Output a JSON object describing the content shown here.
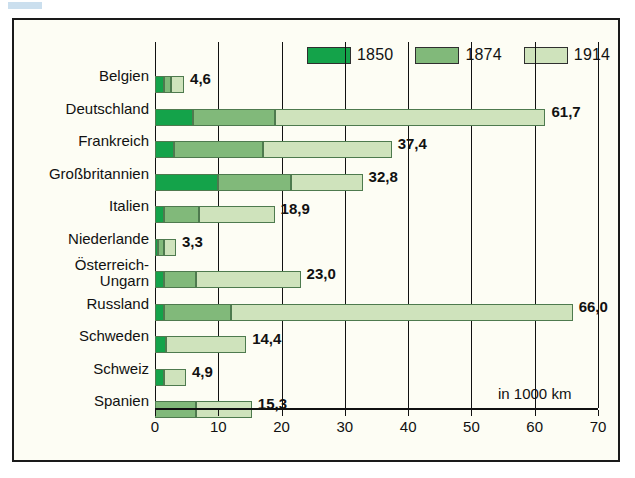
{
  "chart_data": {
    "type": "bar",
    "orientation": "horizontal",
    "stacked": true,
    "title": "",
    "subtitle": "",
    "xlabel": "in 1000 km",
    "ylabel": "",
    "xlim": [
      0,
      70
    ],
    "xticks": [
      0,
      10,
      20,
      30,
      40,
      50,
      60,
      70
    ],
    "xtick_labels": [
      "0",
      "10",
      "20",
      "30",
      "40",
      "50",
      "60",
      "70"
    ],
    "grid": true,
    "grid_axis": "x",
    "legend_position": "top-right",
    "decimal_separator": ",",
    "categories": [
      "Belgien",
      "Deutschland",
      "Frankreich",
      "Großbritannien",
      "Italien",
      "Niederlande",
      "Österreich-Ungarn",
      "Russland",
      "Schweden",
      "Schweiz",
      "Spanien"
    ],
    "category_labels": [
      [
        "Belgien"
      ],
      [
        "Deutschland"
      ],
      [
        "Frankreich"
      ],
      [
        "Großbritannien"
      ],
      [
        "Italien"
      ],
      [
        "Niederlande"
      ],
      [
        "Österreich-",
        "Ungarn"
      ],
      [
        "Russland"
      ],
      [
        "Schweden"
      ],
      [
        "Schweiz"
      ],
      [
        "Spanien"
      ]
    ],
    "series": [
      {
        "name": "1850",
        "color": "#14a34a",
        "values": [
          1.5,
          6.0,
          3.0,
          10.0,
          1.5,
          0.4,
          1.5,
          1.5,
          1.8,
          1.4,
          0.0
        ]
      },
      {
        "name": "1874",
        "color": "#81b97a",
        "values": [
          1.0,
          13.0,
          14.0,
          11.5,
          5.5,
          1.0,
          5.0,
          10.5,
          0.0,
          0.0,
          6.5
        ]
      },
      {
        "name": "1914",
        "color": "#cfe3bc",
        "values": [
          2.1,
          42.7,
          20.4,
          11.3,
          11.9,
          1.9,
          16.5,
          54.0,
          12.6,
          3.5,
          8.8
        ]
      }
    ],
    "totals": [
      4.6,
      61.7,
      37.4,
      32.8,
      18.9,
      3.3,
      23.0,
      66.0,
      14.4,
      4.9,
      15.3
    ],
    "total_labels": [
      "4,6",
      "61,7",
      "37,4",
      "32,8",
      "18,9",
      "3,3",
      "23,0",
      "66,0",
      "14,4",
      "4,9",
      "15,3"
    ],
    "legend": [
      {
        "label": "1850",
        "color": "#14a34a"
      },
      {
        "label": "1874",
        "color": "#81b97a"
      },
      {
        "label": "1914",
        "color": "#cfe3bc"
      }
    ]
  },
  "colors": {
    "background": "#fdfdf4",
    "page": "#ffffff",
    "border": "#1a1a1a",
    "text": "#111111",
    "series_1850": "#14a34a",
    "series_1874": "#81b97a",
    "series_1914": "#cfe3bc",
    "bar_outline": "#4e7a4e"
  }
}
